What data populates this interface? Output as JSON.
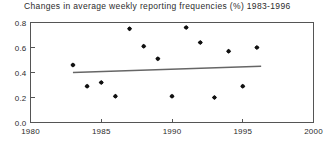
{
  "chart_data": {
    "type": "scatter",
    "title": "Changes in average weekly reporting frequencies (%) 1983-1996",
    "xlabel": "",
    "ylabel": "",
    "xlim": [
      1980,
      2000
    ],
    "ylim": [
      0.0,
      0.8
    ],
    "xticks": [
      1980,
      1985,
      1990,
      1995,
      2000
    ],
    "xtick_labels": [
      "1980",
      "1985",
      "1990",
      "1995",
      "2000"
    ],
    "yticks": [
      0.0,
      0.2,
      0.4,
      0.6,
      0.8
    ],
    "ytick_labels": [
      "0.0",
      "0.2",
      "0.4",
      "0.6",
      "0.8"
    ],
    "grid": false,
    "legend": false,
    "x": [
      1983,
      1984,
      1985,
      1986,
      1987,
      1988,
      1989,
      1990,
      1991,
      1992,
      1993,
      1994,
      1995,
      1996
    ],
    "values": [
      0.46,
      0.29,
      0.32,
      0.21,
      0.75,
      0.61,
      0.51,
      0.21,
      0.76,
      0.64,
      0.2,
      0.57,
      0.29,
      0.6
    ],
    "series": [
      {
        "name": "reporting frequency change",
        "values": [
          0.46,
          0.29,
          0.32,
          0.21,
          0.75,
          0.61,
          0.51,
          0.21,
          0.76,
          0.64,
          0.2,
          0.57,
          0.29,
          0.6
        ]
      }
    ],
    "trend_line": {
      "x_start": 1983,
      "y_start": 0.4,
      "x_end": 1996.3,
      "y_end": 0.45
    }
  }
}
